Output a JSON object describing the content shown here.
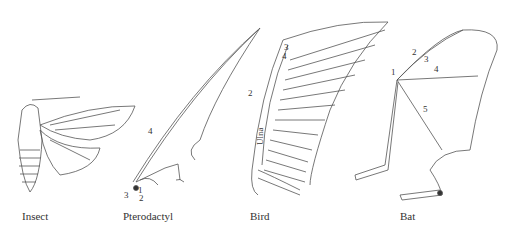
{
  "diagram": {
    "panels": [
      {
        "id": "insect",
        "caption": "Insect",
        "labels": []
      },
      {
        "id": "pterodactyl",
        "caption": "Pterodactyl",
        "labels": [
          "1",
          "2",
          "3",
          "4"
        ]
      },
      {
        "id": "bird",
        "caption": "Bird",
        "labels": [
          "2",
          "3",
          "4"
        ],
        "bone_label": "Ulna"
      },
      {
        "id": "bat",
        "caption": "Bat",
        "labels": [
          "1",
          "2",
          "3",
          "4",
          "5"
        ]
      }
    ],
    "colors": {
      "line": "#555555",
      "background": "#ffffff",
      "text": "#333333"
    }
  }
}
